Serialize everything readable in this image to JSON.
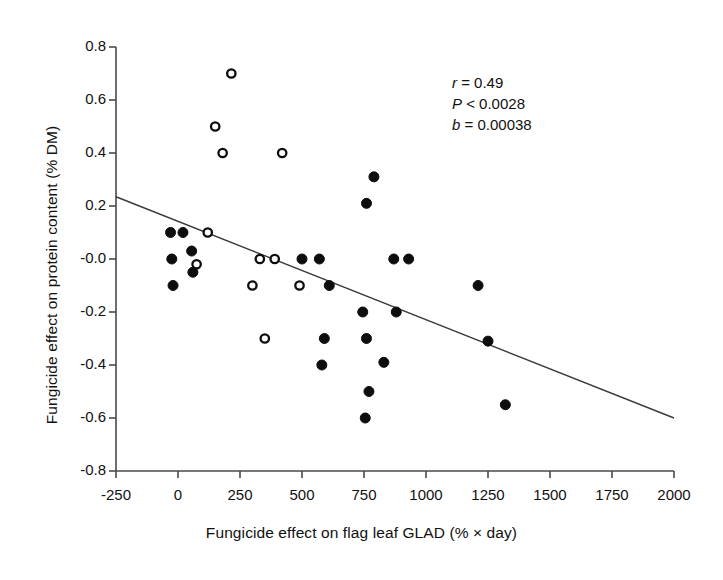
{
  "chart_data": {
    "type": "scatter",
    "title": "",
    "xlabel": "Fungicide effect on flag leaf GLAD (% × day)",
    "ylabel": "Fungicide effect on protein content (% DM)",
    "xlim": [
      -250,
      2000
    ],
    "ylim": [
      -0.8,
      0.8
    ],
    "xticks": [
      -250,
      0,
      250,
      500,
      750,
      1000,
      1250,
      1500,
      1750,
      2000
    ],
    "xtick_labels": [
      "-250",
      "0",
      "250",
      "500",
      "750",
      "1000",
      "1250",
      "1500",
      "1750",
      "2000"
    ],
    "yticks": [
      0.8,
      0.6,
      0.4,
      0.2,
      -0.0,
      -0.2,
      -0.4,
      -0.6,
      -0.8
    ],
    "ytick_labels": [
      "0.8",
      "0.6",
      "0.4",
      "0.2",
      "-0.0",
      "-0.2",
      "-0.4",
      "-0.6",
      "-0.8"
    ],
    "grid": false,
    "legend": null,
    "series": [
      {
        "name": "open-circles",
        "marker": "open-circle",
        "points": [
          [
            215,
            0.7
          ],
          [
            150,
            0.5
          ],
          [
            180,
            0.4
          ],
          [
            420,
            0.4
          ],
          [
            120,
            0.1
          ],
          [
            75,
            -0.02
          ],
          [
            330,
            -0.0
          ],
          [
            390,
            -0.0
          ],
          [
            300,
            -0.1
          ],
          [
            490,
            -0.1
          ],
          [
            350,
            -0.3
          ]
        ]
      },
      {
        "name": "filled-circles",
        "marker": "filled-circle",
        "points": [
          [
            790,
            0.31
          ],
          [
            760,
            0.21
          ],
          [
            -30,
            0.1
          ],
          [
            20,
            0.1
          ],
          [
            55,
            0.03
          ],
          [
            -25,
            -0.0
          ],
          [
            500,
            -0.0
          ],
          [
            870,
            -0.0
          ],
          [
            930,
            -0.0
          ],
          [
            570,
            -0.0
          ],
          [
            60,
            -0.05
          ],
          [
            -20,
            -0.1
          ],
          [
            610,
            -0.1
          ],
          [
            1210,
            -0.1
          ],
          [
            745,
            -0.2
          ],
          [
            880,
            -0.2
          ],
          [
            590,
            -0.3
          ],
          [
            760,
            -0.3
          ],
          [
            1250,
            -0.31
          ],
          [
            580,
            -0.4
          ],
          [
            830,
            -0.39
          ],
          [
            770,
            -0.5
          ],
          [
            1320,
            -0.55
          ],
          [
            755,
            -0.6
          ]
        ]
      }
    ],
    "regression_line": {
      "x_start": -250,
      "y_start": 0.235,
      "x_end": 2000,
      "y_end": -0.6
    },
    "annotations": {
      "r_symbol": "r",
      "r_text": " = 0.49",
      "p_symbol": "P",
      "p_text": " < 0.0028",
      "b_symbol": "b",
      "b_text": " = 0.00038"
    }
  }
}
